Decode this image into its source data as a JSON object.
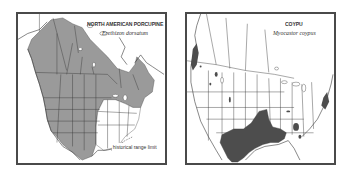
{
  "maps": [
    {
      "common_name": "NORTH AMERICAN PORCUPINE",
      "scientific_name": "Erethizon dorsatum",
      "legend_label": "historical range limit",
      "range_color": "#9a9a9a",
      "region": "North America (Canada, United States, northern Mexico)"
    },
    {
      "common_name": "COYPU",
      "scientific_name": "Myocastor coypus",
      "range_color": "#4d4d4d",
      "region": "United States, southern Canada, northern Mexico"
    }
  ],
  "colors": {
    "frame": "#4a4a4a",
    "border_lines": "#3a3a3a",
    "background": "#ffffff"
  }
}
